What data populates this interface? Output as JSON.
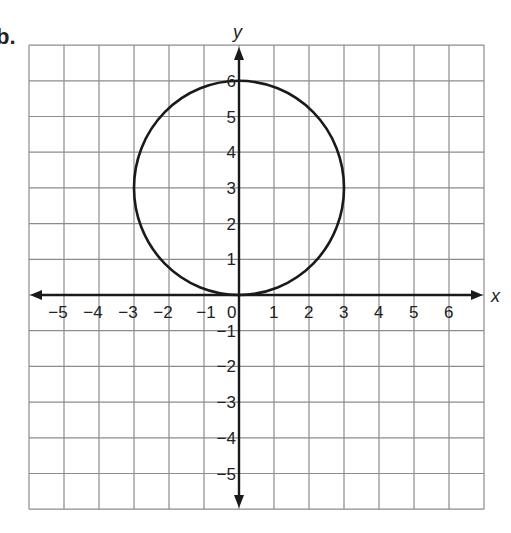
{
  "problem_label": "b.",
  "chart_data": {
    "type": "line",
    "title": "",
    "xlabel": "x",
    "ylabel": "y",
    "xlim": [
      -6,
      7
    ],
    "ylim": [
      -6,
      7
    ],
    "grid": true,
    "x_ticks": [
      -5,
      -4,
      -3,
      -2,
      -1,
      0,
      1,
      2,
      3,
      4,
      5,
      6
    ],
    "y_ticks": [
      -5,
      -4,
      -3,
      -2,
      -1,
      1,
      2,
      3,
      4,
      5,
      6
    ],
    "x_tick_labels": [
      "−5",
      "−4",
      "−3",
      "−2",
      "−1",
      "0",
      "1",
      "2",
      "3",
      "4",
      "5",
      "6"
    ],
    "y_tick_labels": [
      "−5",
      "−4",
      "−3",
      "−2",
      "−1",
      "1",
      "2",
      "3",
      "4",
      "5",
      "6"
    ],
    "series": [
      {
        "name": "circle",
        "shape": "circle",
        "center": [
          0,
          3
        ],
        "radius": 3,
        "key_points": [
          [
            0,
            6
          ],
          [
            3,
            3
          ],
          [
            0,
            0
          ],
          [
            -3,
            3
          ]
        ]
      }
    ]
  },
  "style": {
    "grid_color": "#8c8c8c",
    "axis_color": "#1a1a1a",
    "curve_color": "#1a1a1a",
    "label_color": "#222222"
  }
}
